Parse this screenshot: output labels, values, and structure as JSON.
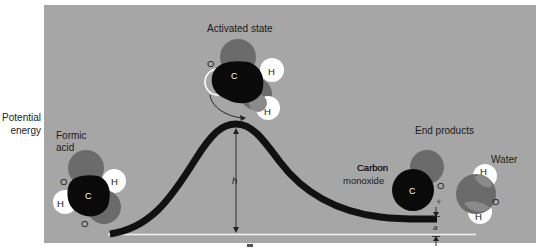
{
  "axis": {
    "ylabel_line1": "Potential",
    "ylabel_line2": "energy"
  },
  "labels": {
    "activated_state": "Activated state",
    "formic_acid_line1": "Formic",
    "formic_acid_line2": "acid",
    "end_products": "End products",
    "carbon_monoxide_line1": "Carbon",
    "carbon_monoxide_line2": "monoxide",
    "water": "Water",
    "plus": "+",
    "h": "h",
    "a": "a"
  },
  "atoms": {
    "carbon": "C",
    "oxygen": "O",
    "hydrogen": "H"
  },
  "colors": {
    "panel": "#a6a6a6",
    "curve": "#111111",
    "baseline": "#f2f2f2",
    "carbon": "#0a0a0a",
    "oxygen": "#6b6b6b",
    "hydrogen": "#ffffff"
  }
}
